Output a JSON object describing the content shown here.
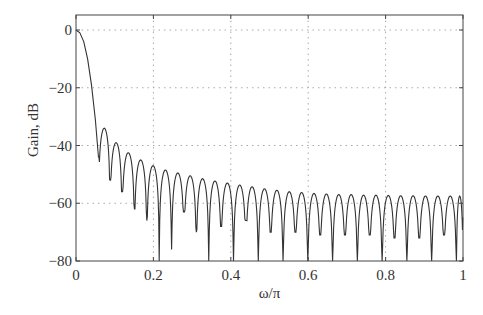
{
  "chart_data": {
    "type": "line",
    "title": "",
    "xlabel": "ω/π",
    "ylabel": "Gain, dB",
    "xlim": [
      0,
      1
    ],
    "ylim": [
      -80,
      0
    ],
    "grid": true,
    "grid_style": "dotted",
    "legend": null,
    "x_ticks": [
      0,
      0.2,
      0.4,
      0.6,
      0.8,
      1
    ],
    "x_tick_labels": [
      "0",
      "0.2",
      "0.4",
      "0.6",
      "0.8",
      "1"
    ],
    "y_ticks": [
      0,
      -20,
      -40,
      -60,
      -80
    ],
    "y_tick_labels": [
      "0",
      "−20",
      "−40",
      "−60",
      "−80"
    ],
    "series": [
      {
        "name": "Gain response",
        "color": "#333333",
        "main_lobe": {
          "x": [
            0,
            0.01,
            0.02,
            0.03,
            0.04,
            0.05,
            0.058
          ],
          "y": [
            0,
            -1,
            -4,
            -10,
            -19,
            -31,
            -44
          ]
        },
        "sidelobe_peaks": {
          "x": [
            0.072,
            0.103,
            0.135,
            0.167,
            0.199,
            0.231,
            0.263,
            0.295,
            0.327,
            0.359,
            0.391,
            0.423,
            0.455,
            0.487,
            0.519,
            0.551,
            0.583,
            0.615,
            0.647,
            0.679,
            0.711,
            0.743,
            0.775,
            0.807,
            0.839,
            0.871,
            0.903,
            0.935,
            0.967,
            0.995
          ],
          "y": [
            -34,
            -39,
            -42.5,
            -45,
            -47,
            -48.5,
            -49.5,
            -50.5,
            -51.5,
            -52.3,
            -53,
            -53.7,
            -54.3,
            -55,
            -55.5,
            -56,
            -56.3,
            -56.6,
            -56.8,
            -57,
            -57,
            -57.2,
            -57.2,
            -57.3,
            -57.4,
            -57.4,
            -57.5,
            -57.5,
            -57.5,
            -57.5
          ]
        },
        "nulls": {
          "x": [
            0.058,
            0.088,
            0.119,
            0.151,
            0.183,
            0.215,
            0.247,
            0.279,
            0.311,
            0.343,
            0.375,
            0.407,
            0.439,
            0.471,
            0.503,
            0.535,
            0.567,
            0.599,
            0.631,
            0.663,
            0.695,
            0.727,
            0.759,
            0.791,
            0.823,
            0.855,
            0.887,
            0.919,
            0.951,
            0.983
          ],
          "y": [
            -44,
            -52,
            -56,
            -62,
            -66,
            -80,
            -76,
            -63,
            -70,
            -80,
            -68,
            -80,
            -66,
            -80,
            -70,
            -80,
            -70,
            -80,
            -71,
            -80,
            -71,
            -80,
            -71,
            -80,
            -72,
            -80,
            -72,
            -80,
            -71,
            -80
          ]
        },
        "final_value": {
          "x": 1.0,
          "y": -65
        }
      }
    ]
  }
}
